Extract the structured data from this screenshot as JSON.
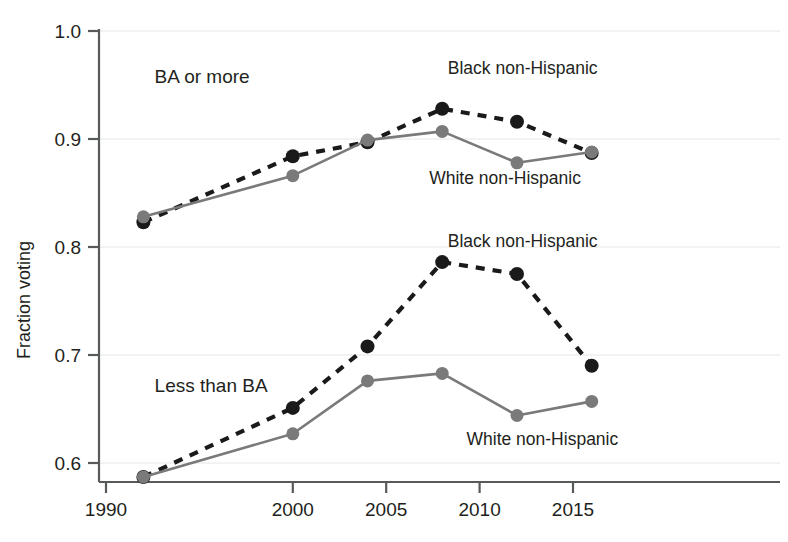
{
  "chart_data": {
    "type": "line",
    "title": "",
    "subtitle": "",
    "xlabel": "",
    "ylabel": "Fraction voting",
    "xlim": [
      1990,
      2017.5
    ],
    "ylim": [
      0.555,
      1.0
    ],
    "grid": "horizontal-light",
    "legend": "inline-annotations",
    "x_ticks": [
      "1990",
      "2000",
      "2005",
      "2010",
      "2015"
    ],
    "x_tick_values": [
      1990,
      2000,
      2005,
      2010,
      2015
    ],
    "y_ticks": [
      "0.6",
      "0.7",
      "0.8",
      "0.9",
      "1.0"
    ],
    "y_tick_values": [
      0.6,
      0.7,
      0.8,
      0.9,
      1.0
    ],
    "x": [
      1992,
      2000,
      2004,
      2008,
      2012,
      2016
    ],
    "series": [
      {
        "name": "Black non-Hispanic",
        "group": "BA or more",
        "style": "dashed",
        "color": "#1a1a1a",
        "values": [
          0.823,
          0.884,
          0.897,
          0.928,
          0.916,
          0.887
        ]
      },
      {
        "name": "White non-Hispanic",
        "group": "BA or more",
        "style": "solid",
        "color": "#7a7a7a",
        "values": [
          0.828,
          0.866,
          0.899,
          0.907,
          0.878,
          0.888
        ]
      },
      {
        "name": "Black non-Hispanic",
        "group": "Less than BA",
        "style": "dashed",
        "color": "#1a1a1a",
        "values": [
          0.587,
          0.651,
          0.708,
          0.786,
          0.775,
          0.69
        ]
      },
      {
        "name": "White non-Hispanic",
        "group": "Less than BA",
        "style": "solid",
        "color": "#7a7a7a",
        "values": [
          0.587,
          0.627,
          0.676,
          0.683,
          0.644,
          0.657
        ]
      }
    ],
    "annotations": [
      {
        "id": "group-upper",
        "text": "BA or more",
        "x": 1992.6,
        "y": 0.952
      },
      {
        "id": "group-lower",
        "text": "Less than BA",
        "x": 1992.6,
        "y": 0.666
      },
      {
        "id": "upper-black",
        "text": "Black non-Hispanic",
        "x": 2008.3,
        "y": 0.96
      },
      {
        "id": "upper-white",
        "text": "White non-Hispanic",
        "x": 2007.3,
        "y": 0.858
      },
      {
        "id": "lower-black",
        "text": "Black non-Hispanic",
        "x": 2008.3,
        "y": 0.8
      },
      {
        "id": "lower-white",
        "text": "White non-Hispanic",
        "x": 2009.3,
        "y": 0.617
      }
    ]
  },
  "axes": {
    "y_axis_title": "Fraction voting"
  },
  "colors": {
    "black_series": "#1a1a1a",
    "white_series": "#7a7a7a",
    "axis": "#58595b",
    "grid": "#e6e6e6",
    "background": "#ffffff",
    "text": "#231f20"
  }
}
